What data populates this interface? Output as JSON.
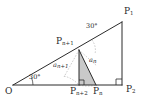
{
  "figure": {
    "kind": "geometry-diagram",
    "colors": {
      "stroke": "#2b2b2b",
      "dashed": "#8d8d8d",
      "shade_fill": "#c9c9c9",
      "background": "#ffffff"
    }
  },
  "vertices": {
    "O": {
      "label": "O",
      "sub": "",
      "x": 13,
      "y": 85
    },
    "P1": {
      "label": "P",
      "sub": "1",
      "x": 122,
      "y": 22
    },
    "P2": {
      "label": "P",
      "sub": "2",
      "x": 122,
      "y": 85
    },
    "Pn": {
      "label": "P",
      "sub": "n",
      "x": 96,
      "y": 85
    },
    "Pn1": {
      "label": "P",
      "sub": "n+1",
      "x": 79,
      "y": 50
    },
    "Pn2": {
      "label": "P",
      "sub": "n+2",
      "x": 79,
      "y": 85
    }
  },
  "labels": {
    "origin": {
      "text": "O"
    },
    "p1": {
      "base": "P",
      "sub": "1"
    },
    "p2": {
      "base": "P",
      "sub": "2"
    },
    "pn": {
      "base": "P",
      "sub": "n"
    },
    "pn1": {
      "base": "P",
      "sub": "n+1"
    },
    "pn2": {
      "base": "P",
      "sub": "n+2"
    },
    "angle_o": {
      "text": "30°"
    },
    "angle_upper": {
      "text": "30°"
    },
    "alpha_n": {
      "base": "a",
      "sub": "n"
    },
    "alpha_n1": {
      "base": "a",
      "sub": "n+1"
    }
  },
  "angles": {
    "at_O": "30°",
    "at_Pn1_upper": "30°",
    "alpha_n": "a_n",
    "alpha_n_plus_1": "a_n+1",
    "right_angles": [
      "P2",
      "Pn+2"
    ]
  }
}
